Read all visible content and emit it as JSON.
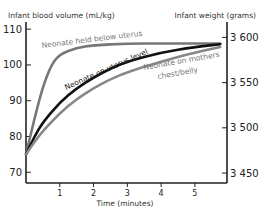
{
  "chart_data": {
    "type": "line",
    "title": "",
    "xlabel": "Time (minutes)",
    "ylabel": "Infant blood volume (mL/kg)",
    "y2label": "Infant weight (grams)",
    "xlim": [
      0,
      5.95
    ],
    "ylim": [
      67,
      112
    ],
    "y2lim": [
      3439,
      3617
    ],
    "xticks": [
      1,
      2,
      3,
      4,
      5
    ],
    "yticks": [
      70,
      80,
      90,
      100,
      110
    ],
    "y2ticks": [
      3450,
      3500,
      3550,
      3600
    ],
    "y2tick_labels": [
      "3 450",
      "3 500",
      "3 550",
      "3 600"
    ],
    "grid": false,
    "series": [
      {
        "name": "Neonate held below uterus",
        "color": "#777777",
        "x": [
          0,
          0.25,
          0.5,
          0.75,
          1.0,
          1.5,
          2,
          3,
          4,
          5,
          5.75
        ],
        "y": [
          75,
          85,
          94,
          100,
          103,
          104.8,
          105.5,
          106,
          106,
          106,
          106
        ]
      },
      {
        "name": "Neonate on uterus level",
        "color": "#111111",
        "x": [
          0,
          0.25,
          0.5,
          1.0,
          1.5,
          2,
          2.5,
          3,
          4,
          5,
          5.75
        ],
        "y": [
          75,
          80,
          84,
          89.5,
          93.5,
          96.5,
          99,
          101,
          103.5,
          105,
          105.8
        ]
      },
      {
        "name": "Neonate on mothers chest/belly",
        "color": "#888888",
        "x": [
          0,
          0.25,
          0.5,
          1.0,
          1.5,
          2,
          2.5,
          3,
          4,
          5,
          5.75
        ],
        "y": [
          75,
          78.5,
          81.5,
          86.5,
          90.5,
          93.5,
          96,
          98,
          101,
          103.5,
          105
        ]
      }
    ]
  }
}
